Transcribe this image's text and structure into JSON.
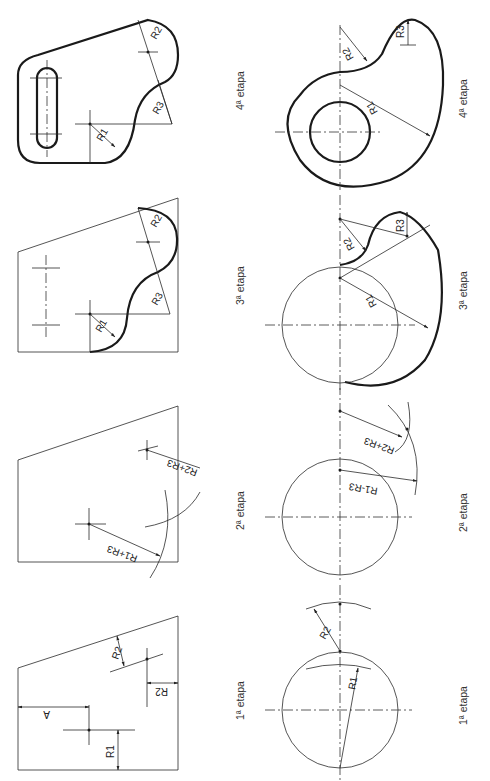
{
  "figure": {
    "stages": [
      {
        "id": 1,
        "label": "1ª etapa"
      },
      {
        "id": 2,
        "label": "2ª etapa"
      },
      {
        "id": 3,
        "label": "3ª etapa"
      },
      {
        "id": 4,
        "label": "4ª etapa"
      }
    ],
    "left_series": {
      "stage1": {
        "dims": [
          "A",
          "R1",
          "R2",
          "R2"
        ]
      },
      "stage2": {
        "dims": [
          "R1+R3",
          "R2+R3"
        ]
      },
      "stage3": {
        "dims": [
          "R1",
          "R2",
          "R3"
        ]
      },
      "stage4": {
        "dims": [
          "R1",
          "R2",
          "R3"
        ]
      }
    },
    "right_series": {
      "stage1": {
        "dims": [
          "R1",
          "R2"
        ]
      },
      "stage2": {
        "dims": [
          "R1-R3",
          "R2+R3"
        ]
      },
      "stage3": {
        "dims": [
          "R1",
          "R2",
          "R3"
        ]
      },
      "stage4": {
        "dims": [
          "R1",
          "R2",
          "R3"
        ]
      }
    }
  }
}
